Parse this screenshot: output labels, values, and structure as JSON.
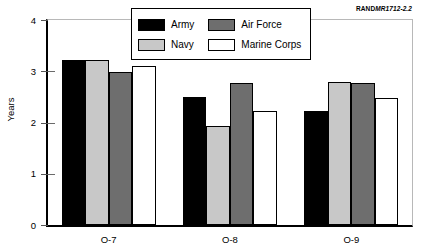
{
  "source_id": {
    "mark": "RAND",
    "number": "MR1712-2.2"
  },
  "chart_data": {
    "type": "bar",
    "title": "",
    "subtitle": "",
    "xlabel": "",
    "ylabel": "Years",
    "categories": [
      "O-7",
      "O-8",
      "O-9"
    ],
    "series": [
      {
        "name": "Army",
        "color": "#000000",
        "values": [
          3.22,
          2.5,
          2.22
        ]
      },
      {
        "name": "Navy",
        "color": "#c8c8c8",
        "values": [
          3.22,
          1.93,
          2.8
        ]
      },
      {
        "name": "Air Force",
        "color": "#6e6e6e",
        "values": [
          2.98,
          2.78,
          2.77
        ]
      },
      {
        "name": "Marine Corps",
        "color": "#ffffff",
        "values": [
          3.1,
          2.22,
          2.48
        ]
      }
    ],
    "ylim": [
      0,
      4
    ],
    "yticks": [
      0,
      1,
      2,
      3,
      4
    ],
    "ytick_labels": [
      "0",
      "1",
      "2",
      "3",
      "4"
    ],
    "grid": false,
    "legend_position": "top-center",
    "bar_edge_color": "#000000"
  }
}
